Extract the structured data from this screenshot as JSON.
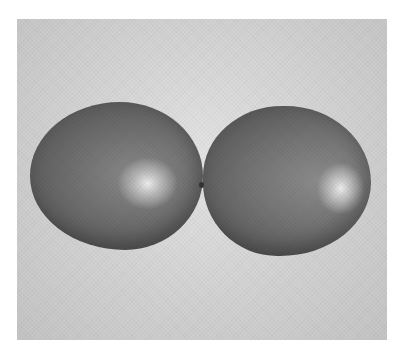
{
  "image": {
    "description": "Grayscale photograph of two inflated balloons tied together at their necks, floating against a light gray background",
    "subjects": [
      {
        "name": "left-balloon",
        "tone": "#6e6e6e",
        "highlight": "#ececec"
      },
      {
        "name": "right-balloon",
        "tone": "#727272",
        "highlight": "#ececec"
      }
    ],
    "background_color": "#d2d2d2",
    "frame_color": "#ffffff"
  }
}
